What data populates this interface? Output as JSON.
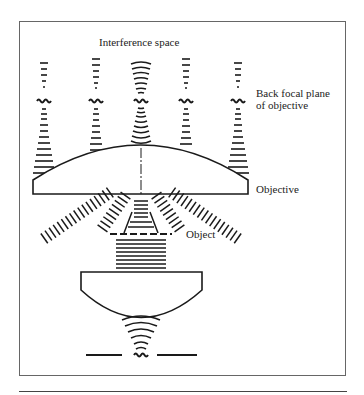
{
  "diagram": {
    "labels": {
      "interference_space": "Interference space",
      "back_focal_plane_line1": "Back focal plane",
      "back_focal_plane_line2": "of objective",
      "objective": "Objective",
      "object": "Object"
    },
    "components": [
      "interference-space",
      "back-focal-plane",
      "objective-lens",
      "object",
      "condenser-lens",
      "light-source"
    ],
    "diffraction_orders": 5,
    "colors": {
      "ink": "#1a1a1a",
      "frame": "#555555",
      "background": "#ffffff"
    }
  }
}
